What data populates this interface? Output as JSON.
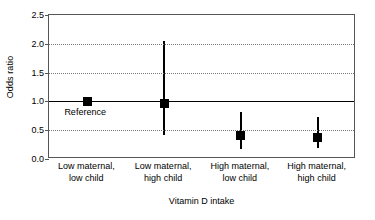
{
  "chart_data": {
    "type": "scatter",
    "title": "",
    "xlabel": "Vitamin D intake",
    "ylabel": "Odds ratio",
    "ylim": [
      0.0,
      2.5
    ],
    "yticks": [
      "0.0",
      "0.5",
      "1.0",
      "1.5",
      "2.0",
      "2.5"
    ],
    "ytick_values": [
      0.0,
      0.5,
      1.0,
      1.5,
      2.0,
      2.5
    ],
    "grid": "horizontal-dotted",
    "gridline_values": [
      0.5,
      1.5,
      2.0
    ],
    "reference_line": 1.0,
    "legend": "none",
    "categories": [
      "Low maternal, low child",
      "Low maternal, high child",
      "High maternal, low child",
      "High maternal, high child"
    ],
    "category_lines": [
      [
        "Low maternal,",
        "low child"
      ],
      [
        "Low maternal,",
        "high child"
      ],
      [
        "High maternal,",
        "low child"
      ],
      [
        "High maternal,",
        "high child"
      ]
    ],
    "series": [
      {
        "name": "Odds ratio (95% CI)",
        "values": [
          1.0,
          0.96,
          0.4,
          0.38
        ],
        "ci_low": [
          null,
          0.42,
          0.18,
          0.19
        ],
        "ci_high": [
          null,
          2.05,
          0.82,
          0.73
        ],
        "marker": "filled-square",
        "color": "#000000"
      }
    ],
    "annotations": [
      {
        "text": "Reference",
        "x_category": 0,
        "y": 0.8
      }
    ]
  },
  "annotations": {
    "reference_label": "Reference"
  },
  "axes": {
    "y_title": "Odds ratio",
    "x_title": "Vitamin D intake"
  }
}
